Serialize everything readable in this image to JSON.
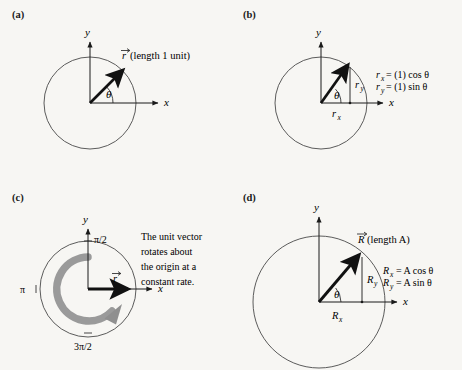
{
  "figure": {
    "background_color": "#f7f6f3",
    "ink_color": "#1a1a1a",
    "accent_gray": "#9a9a9a",
    "circle_stroke": "#4a4a4a"
  },
  "panels": [
    {
      "id": "a",
      "label": "(a)",
      "axis_x": "x",
      "axis_y": "y",
      "angle_symbol": "θ",
      "vector_symbol": "r",
      "vector_label": "(length 1 unit)",
      "circle": {
        "cx": 90,
        "cy": 103,
        "r": 46
      },
      "vector": {
        "angle_deg": 45,
        "length": 46
      }
    },
    {
      "id": "b",
      "label": "(b)",
      "axis_x": "x",
      "axis_y": "y",
      "angle_symbol": "θ",
      "component_x_label": "r",
      "component_x_sub": "x",
      "component_y_label": "r",
      "component_y_sub": "y",
      "equations": [
        {
          "lhs": "r",
          "lhs_sub": "x",
          "rhs": "= (1) cos θ"
        },
        {
          "lhs": "r",
          "lhs_sub": "y",
          "rhs": "= (1) sin θ"
        }
      ],
      "circle": {
        "cx": 90,
        "cy": 103,
        "r": 46
      },
      "vector": {
        "angle_deg": 57,
        "length": 46
      }
    },
    {
      "id": "c",
      "label": "(c)",
      "axis_x": "x",
      "axis_y": "y",
      "vector_symbol": "r",
      "angle_ticks": [
        {
          "value": "π/2",
          "position": "top"
        },
        {
          "value": "π",
          "position": "left"
        },
        {
          "value": "3π/2",
          "position": "bottom"
        }
      ],
      "caption_lines": [
        "The unit vector",
        "rotates about",
        "the origin at a",
        "constant rate."
      ],
      "circle": {
        "cx": 88,
        "cy": 104,
        "r": 48
      },
      "rotation_arc": {
        "color": "#9a9a9a",
        "direction": "counterclockwise"
      }
    },
    {
      "id": "d",
      "label": "(d)",
      "axis_x": "x",
      "axis_y": "y",
      "angle_symbol": "θ",
      "vector_symbol": "R",
      "vector_label": "(length A)",
      "component_x_label": "R",
      "component_x_sub": "x",
      "component_y_label": "R",
      "component_y_sub": "y",
      "equations": [
        {
          "lhs": "R",
          "lhs_sub": "x",
          "rhs": "= A cos θ"
        },
        {
          "lhs": "R",
          "lhs_sub": "y",
          "rhs": "= A sin θ"
        }
      ],
      "circle": {
        "cx": 90,
        "cy": 147,
        "r": 66
      },
      "vector": {
        "angle_deg": 50,
        "length": 66
      }
    }
  ]
}
